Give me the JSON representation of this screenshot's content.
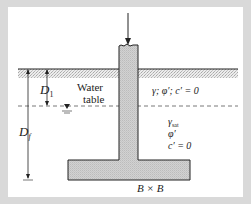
{
  "figure": {
    "labels": {
      "D1": "D",
      "D1_sub": "1",
      "Df": "D",
      "Df_sub": "f",
      "water_table_line1": "Water",
      "water_table_line2": "table",
      "upper_soil": "γ; φ′; c′ = 0",
      "lower_soil_gamma": "γ",
      "lower_soil_gamma_sub": "sat",
      "lower_soil_phi": "φ′",
      "lower_soil_c": "c′ = 0",
      "footing_size": "B × B"
    },
    "colors": {
      "background": "#d9d9d9",
      "panel": "#ffffff",
      "concrete": "#c8c8c8",
      "line": "#222222",
      "soil_stipple": "#bdbdbd"
    }
  }
}
